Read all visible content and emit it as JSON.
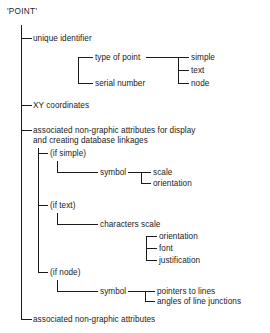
{
  "diagram": {
    "title": "'POINT'",
    "root_label": "'POINT'",
    "nodes": {
      "unique_identifier": "unique identifier",
      "type_of_point": "type of point",
      "serial_number": "serial number",
      "simple": "simple",
      "text": "text",
      "node": "node",
      "xy_coordinates": "XY coordinates",
      "associated_attributes_display": "associated non-graphic attributes for display\nand creating database linkages",
      "if_simple": "(if simple)",
      "symbol_simple": "symbol",
      "scale": "scale",
      "orientation_simple": "orientation",
      "if_text": "(if text)",
      "characters_scale": "characters scale",
      "orientation_text": "orientation",
      "font": "font",
      "justification": "justification",
      "if_node": "(if node)",
      "symbol_node": "symbol",
      "pointers_to_lines": "pointers to lines",
      "angles_of_line_junctions": "angles of line junctions",
      "associated_attributes": "associated non-graphic attributes"
    },
    "colors": {
      "line": "#1a1a1a",
      "text": "#1a1a1a",
      "background": "#ffffff"
    }
  }
}
